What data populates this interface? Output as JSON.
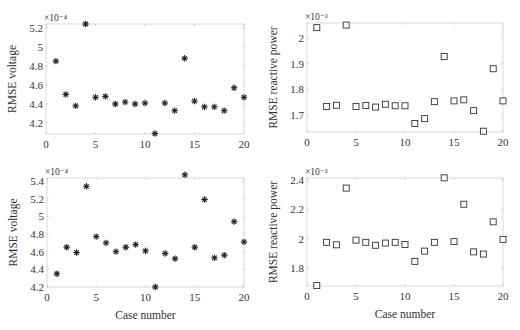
{
  "chart_data": [
    {
      "type": "scatter",
      "position": "top-left",
      "title": "",
      "xlabel": "",
      "ylabel": "RMSE voltage",
      "y_multiplier": "×10⁻⁴",
      "marker": "star",
      "xlim": [
        0,
        20
      ],
      "ylim": [
        4.085,
        5.24
      ],
      "xticks": [
        0,
        5,
        10,
        15,
        20
      ],
      "yticks": [
        4.2,
        4.4,
        4.6,
        4.8,
        5,
        5.2
      ],
      "ytick_labels": [
        "4.2",
        "4.4",
        "4.6",
        "4.8",
        "5",
        "5.2"
      ],
      "x": [
        1,
        2,
        3,
        4,
        5,
        6,
        7,
        8,
        9,
        10,
        11,
        12,
        13,
        14,
        15,
        16,
        17,
        18,
        19,
        20
      ],
      "y": [
        4.85,
        4.5,
        4.38,
        5.24,
        4.47,
        4.48,
        4.4,
        4.42,
        4.4,
        4.41,
        4.09,
        4.41,
        4.33,
        4.88,
        4.43,
        4.37,
        4.37,
        4.33,
        4.57,
        4.47
      ]
    },
    {
      "type": "scatter",
      "position": "top-right",
      "title": "",
      "xlabel": "",
      "ylabel": "RMSE reactive power",
      "y_multiplier": "×10⁻³",
      "marker": "square",
      "xlim": [
        0,
        20
      ],
      "ylim": [
        1.634,
        2.058
      ],
      "xticks": [
        0,
        5,
        10,
        15,
        20
      ],
      "yticks": [
        1.7,
        1.8,
        1.9,
        2.0
      ],
      "ytick_labels": [
        "1.7",
        "1.8",
        "1.9",
        "2"
      ],
      "x": [
        1,
        2,
        3,
        4,
        5,
        6,
        7,
        8,
        9,
        10,
        11,
        12,
        13,
        14,
        15,
        16,
        17,
        18,
        19,
        20
      ],
      "y": [
        2.04,
        1.733,
        1.738,
        2.05,
        1.733,
        1.737,
        1.731,
        1.742,
        1.736,
        1.736,
        1.667,
        1.686,
        1.752,
        1.928,
        1.755,
        1.759,
        1.717,
        1.637,
        1.88,
        1.755
      ]
    },
    {
      "type": "scatter",
      "position": "bottom-left",
      "title": "",
      "xlabel": "Case number",
      "ylabel": "RMSE voltage",
      "y_multiplier": "×10⁻⁴",
      "marker": "star",
      "xlim": [
        0,
        20
      ],
      "ylim": [
        4.2,
        5.434
      ],
      "xticks": [
        0,
        5,
        10,
        15,
        20
      ],
      "yticks": [
        4.2,
        4.4,
        4.6,
        4.8,
        5,
        5.2,
        5.4
      ],
      "ytick_labels": [
        "4.2",
        "4.4",
        "4.6",
        "4.8",
        "5",
        "5.2",
        "5.4"
      ],
      "x": [
        1,
        2,
        3,
        4,
        5,
        6,
        7,
        8,
        9,
        10,
        11,
        12,
        13,
        14,
        15,
        16,
        17,
        18,
        19,
        20
      ],
      "y": [
        4.35,
        4.65,
        4.59,
        5.34,
        4.77,
        4.7,
        4.6,
        4.65,
        4.68,
        4.61,
        4.2,
        4.58,
        4.52,
        5.47,
        4.65,
        5.19,
        4.53,
        4.56,
        4.94,
        4.71
      ]
    },
    {
      "type": "scatter",
      "position": "bottom-right",
      "title": "",
      "xlabel": "Case number",
      "ylabel": "RMSE reactive power",
      "y_multiplier": "×10⁻³",
      "marker": "square",
      "xlim": [
        0,
        20
      ],
      "ylim": [
        1.677,
        2.414
      ],
      "xticks": [
        0,
        5,
        10,
        15,
        20
      ],
      "yticks": [
        1.8,
        2.0,
        2.2,
        2.4
      ],
      "ytick_labels": [
        "1.8",
        "2",
        "2.2",
        "2.4"
      ],
      "x": [
        1,
        2,
        3,
        4,
        5,
        6,
        7,
        8,
        9,
        10,
        11,
        12,
        13,
        14,
        15,
        16,
        17,
        18,
        19,
        20
      ],
      "y": [
        1.68,
        1.975,
        1.958,
        2.345,
        1.99,
        1.975,
        1.955,
        1.97,
        1.975,
        1.96,
        1.845,
        1.915,
        1.975,
        2.415,
        1.98,
        2.235,
        1.91,
        1.895,
        2.115,
        1.995
      ]
    }
  ]
}
